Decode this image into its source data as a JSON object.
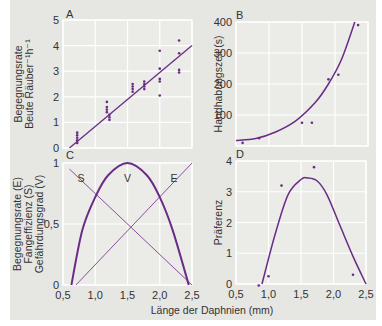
{
  "figure": {
    "xlabel": "Länge der Daphnien (mm)",
    "colors": {
      "background": "#e6e6e3",
      "plot_bg": "#ebebe8",
      "grid": "#ffffff",
      "curve": "#6a2c86",
      "points": "#6a2c86"
    }
  },
  "chart_data": [
    {
      "panel": "A",
      "type": "scatter",
      "title": "A",
      "xlabel": "Länge der Daphnien (mm)",
      "ylabel": [
        "Begegnungsrate",
        "Beute Räuber⁻¹h⁻¹"
      ],
      "xlim": [
        0.5,
        2.5
      ],
      "ylim": [
        0,
        5
      ],
      "yticks": [
        "0",
        "1",
        "2",
        "3",
        "4",
        "5"
      ],
      "grid": true,
      "points": [
        {
          "x": 0.72,
          "y": 0.2
        },
        {
          "x": 0.72,
          "y": 0.3
        },
        {
          "x": 0.72,
          "y": 0.4
        },
        {
          "x": 0.72,
          "y": 0.5
        },
        {
          "x": 0.72,
          "y": 0.6
        },
        {
          "x": 1.22,
          "y": 1.1
        },
        {
          "x": 1.22,
          "y": 1.2
        },
        {
          "x": 1.22,
          "y": 1.3
        },
        {
          "x": 1.18,
          "y": 1.4
        },
        {
          "x": 1.18,
          "y": 1.5
        },
        {
          "x": 1.18,
          "y": 1.6
        },
        {
          "x": 1.18,
          "y": 1.8
        },
        {
          "x": 1.58,
          "y": 2.2
        },
        {
          "x": 1.58,
          "y": 2.3
        },
        {
          "x": 1.58,
          "y": 2.4
        },
        {
          "x": 1.58,
          "y": 2.5
        },
        {
          "x": 1.76,
          "y": 2.3
        },
        {
          "x": 1.76,
          "y": 2.4
        },
        {
          "x": 1.76,
          "y": 2.5
        },
        {
          "x": 1.76,
          "y": 2.6
        },
        {
          "x": 2.0,
          "y": 2.05
        },
        {
          "x": 2.0,
          "y": 2.6
        },
        {
          "x": 2.0,
          "y": 2.7
        },
        {
          "x": 2.0,
          "y": 3.1
        },
        {
          "x": 2.0,
          "y": 3.8
        },
        {
          "x": 2.3,
          "y": 2.95
        },
        {
          "x": 2.3,
          "y": 3.05
        },
        {
          "x": 2.3,
          "y": 3.7
        },
        {
          "x": 2.3,
          "y": 4.2
        }
      ],
      "line": {
        "x": [
          0.6,
          2.5
        ],
        "y": [
          0.0,
          4.0
        ]
      }
    },
    {
      "panel": "B",
      "type": "scatter",
      "title": "B",
      "xlabel": "Länge der Daphnien (mm)",
      "ylabel": "Handhabungszeit (s)",
      "xlim": [
        0.5,
        2.5
      ],
      "ylim": [
        0,
        400
      ],
      "yticks": [
        "100",
        "200",
        "300",
        "400"
      ],
      "grid": true,
      "points": [
        {
          "x": 0.6,
          "y": 10
        },
        {
          "x": 0.85,
          "y": 25
        },
        {
          "x": 1.5,
          "y": 75
        },
        {
          "x": 1.65,
          "y": 75
        },
        {
          "x": 1.9,
          "y": 215
        },
        {
          "x": 2.05,
          "y": 230
        },
        {
          "x": 2.35,
          "y": 390
        }
      ],
      "curve": {
        "x": [
          0.5,
          0.8,
          1.1,
          1.4,
          1.7,
          1.9,
          2.1,
          2.3
        ],
        "y": [
          18,
          24,
          45,
          80,
          140,
          200,
          280,
          400
        ]
      }
    },
    {
      "panel": "C",
      "type": "line",
      "title": "C",
      "xlabel": "Länge der Daphnien (mm)",
      "ylabel": [
        "Begegnungsrate (E)",
        "Fangeffizienz (S)",
        "Gefährdungsgrad (V)"
      ],
      "xlim": [
        0.5,
        2.5
      ],
      "ylim": [
        0,
        1
      ],
      "xticks": [
        "0,5",
        "1,0",
        "1,5",
        "2,0",
        "2,5"
      ],
      "yticks": [
        "0",
        "0,5",
        "1"
      ],
      "grid": true,
      "series": [
        {
          "name": "S",
          "x": [
            0.6,
            2.5
          ],
          "y": [
            0.95,
            0.0
          ]
        },
        {
          "name": "E",
          "x": [
            0.7,
            2.5
          ],
          "y": [
            0.0,
            1.0
          ]
        },
        {
          "name": "V",
          "x": [
            0.63,
            0.8,
            1.0,
            1.2,
            1.5,
            1.8,
            2.0,
            2.2,
            2.45
          ],
          "y": [
            0.0,
            0.45,
            0.72,
            0.9,
            1.0,
            0.9,
            0.72,
            0.45,
            0.0
          ]
        }
      ],
      "annotations": [
        "S",
        "V",
        "E"
      ]
    },
    {
      "panel": "D",
      "type": "scatter",
      "title": "D",
      "xlabel": "Länge der Daphnien (mm)",
      "ylabel": "Präferenz",
      "xlim": [
        0.5,
        2.5
      ],
      "ylim": [
        0,
        4
      ],
      "xticks": [
        "0,5",
        "1,0",
        "1,5",
        "2,0",
        "2,5"
      ],
      "yticks": [
        "0",
        "1",
        "2",
        "3",
        "4"
      ],
      "grid": true,
      "points": [
        {
          "x": 0.85,
          "y": -0.05
        },
        {
          "x": 1.0,
          "y": 0.25
        },
        {
          "x": 1.2,
          "y": 3.2
        },
        {
          "x": 1.7,
          "y": 3.8
        },
        {
          "x": 2.3,
          "y": 0.3
        }
      ],
      "curve": {
        "x": [
          0.9,
          1.1,
          1.3,
          1.5,
          1.6,
          1.75,
          1.9,
          2.1,
          2.3,
          2.5
        ],
        "y": [
          0.0,
          1.6,
          2.9,
          3.4,
          3.45,
          3.35,
          2.9,
          1.9,
          0.9,
          0.0
        ]
      }
    }
  ]
}
